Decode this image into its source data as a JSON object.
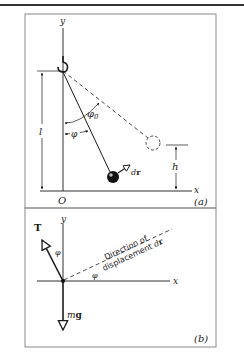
{
  "figure": {
    "panel_a": {
      "label": "(a)",
      "axis_y": "y",
      "axis_x": "x",
      "origin": "O",
      "length_label": "l",
      "height_label": "h",
      "angle_max_label": "φ0",
      "angle_label": "φ",
      "displacement_label": "dr"
    },
    "panel_b": {
      "label": "(b)",
      "axis_y": "y",
      "axis_x": "x",
      "tension_label": "T",
      "angle_label_1": "φ",
      "angle_label_2": "φ",
      "direction_line1": "Direction of",
      "direction_line2": "displacement dr",
      "weight_label": "mg"
    }
  },
  "colors": {
    "ink": "#1a1a1a",
    "frame": "#8a8a8a",
    "background": "#ffffff"
  }
}
